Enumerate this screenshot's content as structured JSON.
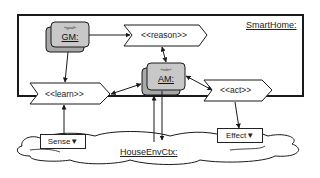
{
  "diagram": {
    "container": {
      "label": "SmartHome:"
    },
    "environment": {
      "label": "HouseEnvCtx:"
    },
    "components": [
      {
        "id": "gm",
        "stereotype": "«goal»",
        "label": "GM:"
      },
      {
        "id": "am",
        "stereotype": "«role»",
        "label": "AM:"
      }
    ],
    "actions": [
      {
        "id": "reason",
        "label": "<<reason>>"
      },
      {
        "id": "learn",
        "label": "<<learn>>"
      },
      {
        "id": "act",
        "label": "<<act>>"
      }
    ],
    "pins": [
      {
        "id": "sense",
        "label": "Sense▼"
      },
      {
        "id": "effect",
        "label": "Effect▼"
      }
    ],
    "connections": [
      {
        "from": "GM",
        "to": "<<reason>>",
        "type": "directed"
      },
      {
        "from": "GM",
        "to": "<<learn>>",
        "type": "directed"
      },
      {
        "from": "<<reason>>",
        "to": "AM",
        "type": "bidirectional"
      },
      {
        "from": "<<learn>>",
        "to": "AM",
        "type": "bidirectional"
      },
      {
        "from": "<<act>>",
        "to": "AM",
        "type": "bidirectional"
      },
      {
        "from": "Sense",
        "to": "<<learn>>",
        "type": "directed"
      },
      {
        "from": "<<act>>",
        "to": "Effect",
        "type": "directed"
      },
      {
        "from": "HouseEnvCtx",
        "to": "AM",
        "type": "directed"
      },
      {
        "from": "AM",
        "to": "HouseEnvCtx",
        "type": "directed"
      }
    ],
    "colors": {
      "component_fill": "#c8c8c8",
      "component_shadow": "#a9a9a9",
      "stroke": "#1a1a1a"
    }
  }
}
